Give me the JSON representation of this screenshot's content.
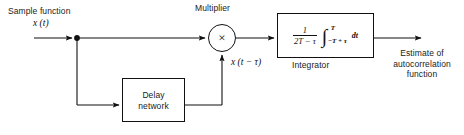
{
  "diagram": {
    "background_color": "#ffffff",
    "line_color": "#111111",
    "input": {
      "caption": "Sample function",
      "signal_label": "x (t)"
    },
    "multiplier": {
      "caption": "Multiplier",
      "glyph": "×",
      "icon_name": "multiply-icon",
      "second_input_label": "x (t − τ)"
    },
    "integrator": {
      "caption": "Integrator",
      "expression": {
        "fraction_numerator": "1",
        "fraction_denominator": "2T − τ",
        "integral_sign": "∫",
        "upper_limit": "T",
        "lower_limit": "−T + τ",
        "differential": "dt"
      }
    },
    "delay": {
      "caption_line1": "Delay",
      "caption_line2": "network"
    },
    "output": {
      "caption_line1": "Estimate of",
      "caption_line2": "autocorrelation",
      "caption_line3": "function"
    },
    "junction": {
      "name": "signal-split-node"
    }
  }
}
